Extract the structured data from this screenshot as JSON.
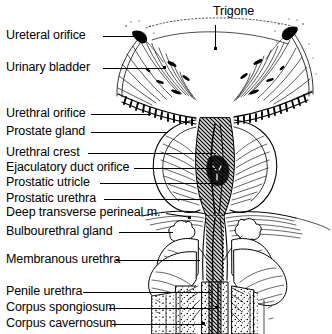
{
  "figure": {
    "style": "black-and-white engraved line drawing",
    "background_color": "#ffffff",
    "ink_color": "#000000"
  },
  "labels": {
    "trigone": "Trigone",
    "ureteral_orifice": "Ureteral orifice",
    "urinary_bladder": "Urinary bladder",
    "urethral_orifice": "Urethral orifice",
    "prostate_gland": "Prostate gland",
    "urethral_crest": "Urethral crest",
    "ejaculatory_duct_orifice": "Ejaculatory duct orifice",
    "prostatic_utricle": "Prostatic utricle",
    "prostatic_urethra": "Prostatic urethra",
    "deep_transverse_perineal": "Deep transverse perineal m.",
    "bulbourethral_gland": "Bulbourethral gland",
    "membranous_urethra": "Membranous urethra",
    "penile_urethra": "Penile urethra",
    "corpus_spongiosum": "Corpus spongiosum",
    "corpus_cavernosum": "Corpus cavernosum"
  }
}
